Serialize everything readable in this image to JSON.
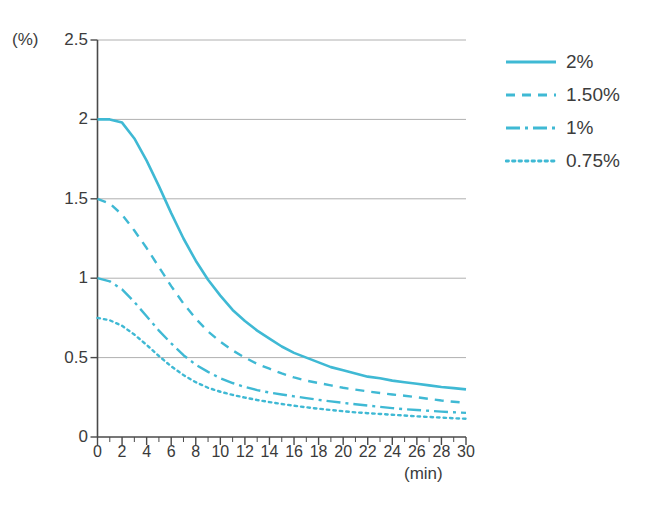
{
  "chart_data": {
    "type": "line",
    "title": "",
    "subtitle": "",
    "xlabel": "(min)",
    "ylabel": "(%)",
    "xlim": [
      0,
      30
    ],
    "ylim": [
      0,
      2.5
    ],
    "grid": true,
    "grid_axis": "y",
    "legend_position": "right",
    "line_color": "#3fb9d4",
    "x": [
      0,
      1,
      2,
      3,
      4,
      5,
      6,
      7,
      8,
      9,
      10,
      11,
      12,
      13,
      14,
      15,
      16,
      17,
      18,
      19,
      20,
      21,
      22,
      23,
      24,
      25,
      26,
      27,
      28,
      29,
      30
    ],
    "xticks": [
      0,
      2,
      4,
      6,
      8,
      10,
      12,
      14,
      16,
      18,
      20,
      22,
      24,
      26,
      28,
      30
    ],
    "xtick_labels": [
      "0",
      "2",
      "4",
      "6",
      "8",
      "10",
      "12",
      "14",
      "16",
      "18",
      "20",
      "22",
      "24",
      "26",
      "28",
      "30"
    ],
    "xminor_step": 1,
    "yticks": [
      0,
      0.5,
      1,
      1.5,
      2,
      2.5
    ],
    "ytick_labels": [
      "0",
      "0.5",
      "1",
      "1.5",
      "2",
      "2.5"
    ],
    "series": [
      {
        "name": "2%",
        "style": "solid",
        "dasharray": "",
        "values": [
          2.0,
          2.0,
          1.98,
          1.88,
          1.74,
          1.58,
          1.41,
          1.25,
          1.11,
          0.99,
          0.89,
          0.8,
          0.73,
          0.67,
          0.62,
          0.57,
          0.53,
          0.5,
          0.47,
          0.44,
          0.42,
          0.4,
          0.38,
          0.37,
          0.355,
          0.345,
          0.335,
          0.325,
          0.315,
          0.308,
          0.3
        ]
      },
      {
        "name": "1.50%",
        "style": "dashed",
        "dasharray": "9,7",
        "values": [
          1.5,
          1.47,
          1.4,
          1.3,
          1.19,
          1.07,
          0.95,
          0.84,
          0.745,
          0.665,
          0.6,
          0.545,
          0.5,
          0.46,
          0.43,
          0.4,
          0.375,
          0.355,
          0.34,
          0.325,
          0.31,
          0.298,
          0.287,
          0.277,
          0.268,
          0.26,
          0.25,
          0.24,
          0.23,
          0.222,
          0.215
        ]
      },
      {
        "name": "1%",
        "style": "dashdot",
        "dasharray": "14,5,3,5",
        "values": [
          1.0,
          0.98,
          0.93,
          0.85,
          0.76,
          0.67,
          0.59,
          0.515,
          0.455,
          0.41,
          0.37,
          0.34,
          0.315,
          0.295,
          0.28,
          0.268,
          0.256,
          0.245,
          0.234,
          0.224,
          0.215,
          0.206,
          0.198,
          0.19,
          0.182,
          0.175,
          0.17,
          0.165,
          0.16,
          0.156,
          0.152
        ]
      },
      {
        "name": "0.75%",
        "style": "dotted",
        "dasharray": "2.5,4",
        "values": [
          0.75,
          0.735,
          0.7,
          0.645,
          0.58,
          0.51,
          0.445,
          0.39,
          0.345,
          0.31,
          0.285,
          0.265,
          0.248,
          0.233,
          0.22,
          0.208,
          0.197,
          0.187,
          0.178,
          0.17,
          0.162,
          0.155,
          0.15,
          0.145,
          0.14,
          0.135,
          0.13,
          0.126,
          0.122,
          0.118,
          0.115
        ]
      }
    ]
  },
  "legend": {
    "items": [
      {
        "label": "2%",
        "style": "solid"
      },
      {
        "label": "1.50%",
        "style": "dashed"
      },
      {
        "label": "1%",
        "style": "dashdot"
      },
      {
        "label": "0.75%",
        "style": "dotted"
      }
    ]
  },
  "axes": {
    "y_unit": "(%)",
    "x_unit": "(min)"
  },
  "colors": {
    "line": "#3fb9d4",
    "axis": "#4a4a4a",
    "grid": "#b0b0b0",
    "text": "#3c3c3c"
  }
}
